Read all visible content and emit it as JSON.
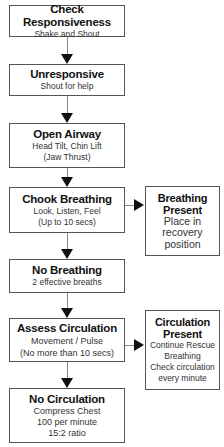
{
  "flowchart": {
    "main_steps": [
      {
        "title": "Check Responsiveness",
        "lines": [
          "Shake and Shout"
        ]
      },
      {
        "title": "Unresponsive",
        "lines": [
          "Shout for help"
        ]
      },
      {
        "title": "Open Airway",
        "lines": [
          "Head Tilt, Chin Lift",
          "(Jaw Thrust)"
        ]
      },
      {
        "title": "Chook Breathing",
        "lines": [
          "Look, Listen, Feel",
          "(Up to 10 secs)"
        ]
      },
      {
        "title": "No Breathing",
        "lines": [
          "2 effective breaths"
        ]
      },
      {
        "title": "Assess Circulation",
        "lines": [
          "Movement / Pulse",
          "(No more than 10 secs)"
        ]
      },
      {
        "title": "No Circulation",
        "lines": [
          "Compress Chest",
          "100 per minute",
          "15:2 ratio"
        ]
      }
    ],
    "side_steps": [
      {
        "title_lines": [
          "Breathing",
          "Present"
        ],
        "lines": [
          "Place in",
          "recovery",
          "position"
        ]
      },
      {
        "title_lines": [
          "Circulation",
          "Present"
        ],
        "lines": [
          "Continue Rescue",
          "Breathing",
          "Check circulation",
          "every minute"
        ]
      }
    ]
  }
}
